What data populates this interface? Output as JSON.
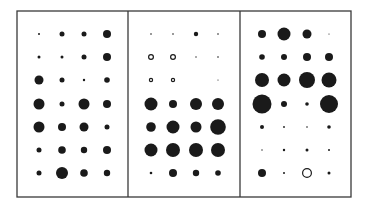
{
  "chart_data": {
    "type": "scatter",
    "subtype": "dot-matrix (bubble grid)",
    "title": "",
    "xlabel": "",
    "ylabel": "",
    "legend": [],
    "grid": false,
    "encoding": "Dot radius encodes magnitude; filled = positive, open circle = negative",
    "panels": [
      {
        "id": "panel-1",
        "rows": 7,
        "cols": 4,
        "cells": [
          [
            {
              "r": 1.0,
              "fill": "filled"
            },
            {
              "r": 2.5,
              "fill": "filled"
            },
            {
              "r": 2.5,
              "fill": "filled"
            },
            {
              "r": 4.0,
              "fill": "filled"
            }
          ],
          [
            {
              "r": 1.5,
              "fill": "filled"
            },
            {
              "r": 1.5,
              "fill": "filled"
            },
            {
              "r": 2.5,
              "fill": "filled"
            },
            {
              "r": 4.0,
              "fill": "filled"
            }
          ],
          [
            {
              "r": 4.5,
              "fill": "filled"
            },
            {
              "r": 2.5,
              "fill": "filled"
            },
            {
              "r": 1.2,
              "fill": "filled"
            },
            {
              "r": 2.8,
              "fill": "filled"
            }
          ],
          [
            {
              "r": 5.5,
              "fill": "filled"
            },
            {
              "r": 2.5,
              "fill": "filled"
            },
            {
              "r": 5.5,
              "fill": "filled"
            },
            {
              "r": 4.0,
              "fill": "filled"
            }
          ],
          [
            {
              "r": 5.5,
              "fill": "filled"
            },
            {
              "r": 4.0,
              "fill": "filled"
            },
            {
              "r": 4.5,
              "fill": "filled"
            },
            {
              "r": 2.5,
              "fill": "filled"
            }
          ],
          [
            {
              "r": 2.5,
              "fill": "filled"
            },
            {
              "r": 3.8,
              "fill": "filled"
            },
            {
              "r": 3.2,
              "fill": "filled"
            },
            {
              "r": 4.0,
              "fill": "filled"
            }
          ],
          [
            {
              "r": 2.5,
              "fill": "filled"
            },
            {
              "r": 6.0,
              "fill": "filled"
            },
            {
              "r": 3.8,
              "fill": "filled"
            },
            {
              "r": 3.2,
              "fill": "filled"
            }
          ]
        ]
      },
      {
        "id": "panel-2",
        "rows": 7,
        "cols": 4,
        "cells": [
          [
            {
              "r": 0.8,
              "fill": "filled"
            },
            {
              "r": 0.8,
              "fill": "filled"
            },
            {
              "r": 2.2,
              "fill": "filled"
            },
            {
              "r": 0.8,
              "fill": "filled"
            }
          ],
          [
            {
              "r": 3.0,
              "fill": "open"
            },
            {
              "r": 3.0,
              "fill": "open"
            },
            {
              "r": 0.7,
              "fill": "filled"
            },
            {
              "r": 0.8,
              "fill": "filled"
            }
          ],
          [
            {
              "r": 2.2,
              "fill": "open"
            },
            {
              "r": 2.2,
              "fill": "open"
            },
            {
              "r": 0,
              "fill": "none"
            },
            {
              "r": 0.6,
              "fill": "filled"
            }
          ],
          [
            {
              "r": 6.5,
              "fill": "filled"
            },
            {
              "r": 4.0,
              "fill": "filled"
            },
            {
              "r": 6.0,
              "fill": "filled"
            },
            {
              "r": 6.0,
              "fill": "filled"
            }
          ],
          [
            {
              "r": 4.8,
              "fill": "filled"
            },
            {
              "r": 6.5,
              "fill": "filled"
            },
            {
              "r": 5.5,
              "fill": "filled"
            },
            {
              "r": 7.8,
              "fill": "filled"
            }
          ],
          [
            {
              "r": 6.5,
              "fill": "filled"
            },
            {
              "r": 7.0,
              "fill": "filled"
            },
            {
              "r": 7.0,
              "fill": "filled"
            },
            {
              "r": 7.0,
              "fill": "filled"
            }
          ],
          [
            {
              "r": 1.3,
              "fill": "filled"
            },
            {
              "r": 4.0,
              "fill": "filled"
            },
            {
              "r": 3.2,
              "fill": "filled"
            },
            {
              "r": 2.8,
              "fill": "filled"
            }
          ]
        ]
      },
      {
        "id": "panel-3",
        "rows": 7,
        "cols": 4,
        "cells": [
          [
            {
              "r": 4.0,
              "fill": "filled"
            },
            {
              "r": 6.5,
              "fill": "filled"
            },
            {
              "r": 4.5,
              "fill": "filled"
            },
            {
              "r": 0.6,
              "fill": "filled"
            }
          ],
          [
            {
              "r": 2.8,
              "fill": "filled"
            },
            {
              "r": 3.0,
              "fill": "filled"
            },
            {
              "r": 4.0,
              "fill": "filled"
            },
            {
              "r": 4.0,
              "fill": "filled"
            }
          ],
          [
            {
              "r": 7.0,
              "fill": "filled"
            },
            {
              "r": 6.5,
              "fill": "filled"
            },
            {
              "r": 8.0,
              "fill": "filled"
            },
            {
              "r": 7.5,
              "fill": "filled"
            }
          ],
          [
            {
              "r": 9.5,
              "fill": "filled"
            },
            {
              "r": 3.0,
              "fill": "filled"
            },
            {
              "r": 1.8,
              "fill": "filled"
            },
            {
              "r": 9.0,
              "fill": "filled"
            }
          ],
          [
            {
              "r": 2.0,
              "fill": "filled"
            },
            {
              "r": 0.9,
              "fill": "filled"
            },
            {
              "r": 0.8,
              "fill": "filled"
            },
            {
              "r": 1.8,
              "fill": "filled"
            }
          ],
          [
            {
              "r": 0.7,
              "fill": "filled"
            },
            {
              "r": 1.2,
              "fill": "filled"
            },
            {
              "r": 1.5,
              "fill": "filled"
            },
            {
              "r": 1.0,
              "fill": "filled"
            }
          ],
          [
            {
              "r": 4.0,
              "fill": "filled"
            },
            {
              "r": 1.0,
              "fill": "filled"
            },
            {
              "r": 5.0,
              "fill": "open"
            },
            {
              "r": 1.5,
              "fill": "filled"
            }
          ]
        ]
      }
    ]
  },
  "layout": {
    "frame": {
      "x": 17,
      "y": 11,
      "width": 334,
      "height": 186
    },
    "dividers_x": [
      128,
      240
    ],
    "col_x": [
      [
        39,
        62,
        84,
        107
      ],
      [
        151,
        173,
        196,
        218
      ],
      [
        262,
        284,
        307,
        329
      ]
    ],
    "row_y": [
      34,
      57,
      80,
      104,
      127,
      150,
      173
    ],
    "colors": {
      "ink": "#1a1a1a",
      "border": "#3a3a3a",
      "background": "#ffffff"
    }
  }
}
